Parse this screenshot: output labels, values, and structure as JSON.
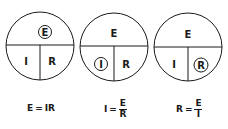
{
  "diagram": {
    "circles": [
      {
        "top": "E",
        "left": "I",
        "right": "R",
        "highlighted": "E"
      },
      {
        "top": "E",
        "left": "I",
        "right": "R",
        "highlighted": "I"
      },
      {
        "top": "E",
        "left": "I",
        "right": "R",
        "highlighted": "R"
      }
    ],
    "formulas": [
      {
        "lhs": "E",
        "eq": "=",
        "rhs": "IR"
      },
      {
        "lhs": "I",
        "eq": "=",
        "num": "E",
        "den": "R"
      },
      {
        "lhs": "R",
        "eq": "=",
        "num": "E",
        "den": "I"
      }
    ],
    "colors": {
      "stroke": "#1a1a1a",
      "background": "#ffffff"
    }
  }
}
